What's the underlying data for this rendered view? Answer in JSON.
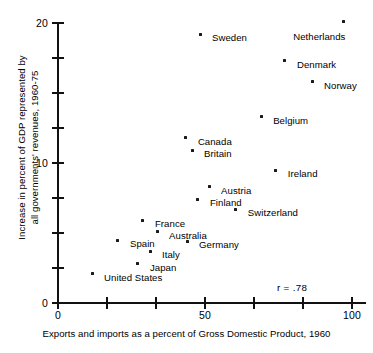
{
  "chart_data": {
    "type": "scatter",
    "title": "",
    "xlabel": "Exports and imports as a percent of Gross Domestic Product, 1960",
    "ylabel_line1": "Increase in percent of GDP represented by",
    "ylabel_line2": "all governments' revenues, 1960-75",
    "xlim": [
      0,
      102
    ],
    "ylim": [
      0,
      20.5
    ],
    "grid": false,
    "legend": null,
    "annotation": "r = .78",
    "xticks": [
      {
        "value": 0,
        "label": "0"
      },
      {
        "value": 16.7,
        "label": ""
      },
      {
        "value": 33.3,
        "label": ""
      },
      {
        "value": 50,
        "label": "50"
      },
      {
        "value": 66.7,
        "label": ""
      },
      {
        "value": 83.3,
        "label": ""
      },
      {
        "value": 100,
        "label": "100"
      }
    ],
    "yticks": [
      {
        "value": 0,
        "label": "0"
      },
      {
        "value": 2.5,
        "label": ""
      },
      {
        "value": 5,
        "label": ""
      },
      {
        "value": 7.5,
        "label": ""
      },
      {
        "value": 10,
        "label": "10"
      },
      {
        "value": 12.5,
        "label": ""
      },
      {
        "value": 15,
        "label": ""
      },
      {
        "value": 17.5,
        "label": ""
      },
      {
        "value": 20,
        "label": "20"
      }
    ],
    "points": [
      {
        "label": "Netherlands",
        "x": 97.0,
        "y": 20.1,
        "label_dx": -50,
        "label_dy": 10
      },
      {
        "label": "Sweden",
        "x": 48.3,
        "y": 19.2,
        "label_dx": 12,
        "label_dy": -1
      },
      {
        "label": "Denmark",
        "x": 77.2,
        "y": 17.3,
        "label_dx": 12,
        "label_dy": -1
      },
      {
        "label": "Norway",
        "x": 86.4,
        "y": 15.8,
        "label_dx": 12,
        "label_dy": -1
      },
      {
        "label": "Belgium",
        "x": 69.1,
        "y": 13.3,
        "label_dx": 12,
        "label_dy": -1
      },
      {
        "label": "Canada",
        "x": 43.5,
        "y": 11.8,
        "label_dx": 12,
        "label_dy": -1
      },
      {
        "label": "Britain",
        "x": 45.6,
        "y": 10.9,
        "label_dx": 12,
        "label_dy": -1
      },
      {
        "label": "Ireland",
        "x": 74.1,
        "y": 9.5,
        "label_dx": 12,
        "label_dy": -1
      },
      {
        "label": "Austria",
        "x": 51.4,
        "y": 8.3,
        "label_dx": 12,
        "label_dy": -1
      },
      {
        "label": "Finland",
        "x": 47.6,
        "y": 7.4,
        "label_dx": 12,
        "label_dy": -1
      },
      {
        "label": "Switzerland",
        "x": 60.5,
        "y": 6.7,
        "label_dx": 12,
        "label_dy": -1
      },
      {
        "label": "France",
        "x": 28.9,
        "y": 5.9,
        "label_dx": 12,
        "label_dy": -1
      },
      {
        "label": "Australia",
        "x": 33.7,
        "y": 5.1,
        "label_dx": 12,
        "label_dy": -1
      },
      {
        "label": "Germany",
        "x": 43.9,
        "y": 4.4,
        "label_dx": 12,
        "label_dy": -1
      },
      {
        "label": "Spain",
        "x": 20.4,
        "y": 4.5,
        "label_dx": 12,
        "label_dy": -1
      },
      {
        "label": "Italy",
        "x": 31.3,
        "y": 3.7,
        "label_dx": 12,
        "label_dy": -1
      },
      {
        "label": "Japan",
        "x": 27.2,
        "y": 2.8,
        "label_dx": 12,
        "label_dy": -1
      },
      {
        "label": "United States",
        "x": 11.6,
        "y": 2.1,
        "label_dx": 12,
        "label_dy": -1
      }
    ]
  }
}
